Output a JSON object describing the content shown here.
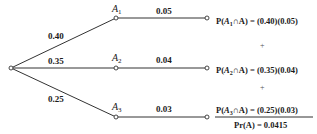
{
  "diagram": {
    "type": "probability-tree",
    "root": {
      "x": 11,
      "y": 68
    },
    "branches": [
      {
        "node_label": "A",
        "node_subscript": "1",
        "prob_first": "0.40",
        "prob_second": "0.05",
        "formula_prefix": "P(",
        "formula_event": "A",
        "formula_sub": "1",
        "formula_suffix": "∩A) = (0.40)(0.05)",
        "y": 18
      },
      {
        "node_label": "A",
        "node_subscript": "2",
        "prob_first": "0.35",
        "prob_second": "0.04",
        "formula_prefix": "P(",
        "formula_event": "A",
        "formula_sub": "2",
        "formula_suffix": "∩A) = (0.35)(0.04)",
        "y": 68
      },
      {
        "node_label": "A",
        "node_subscript": "3",
        "prob_first": "0.25",
        "prob_second": "0.03",
        "formula_prefix": "P(",
        "formula_event": "A",
        "formula_sub": "3",
        "formula_suffix": "∩A) = (0.25)(0.03)",
        "y": 117
      }
    ],
    "plus_signs": [
      "+",
      "+"
    ],
    "total": "Pr(A) = 0.0415"
  }
}
